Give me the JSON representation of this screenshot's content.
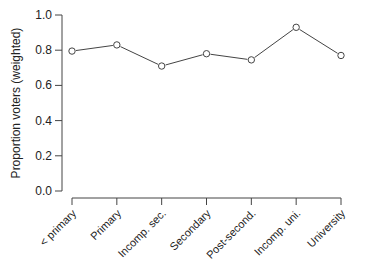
{
  "chart_data": {
    "type": "line",
    "title": "",
    "xlabel": "",
    "ylabel": "Proportion voters (weighted)",
    "ylim": [
      0,
      1
    ],
    "yticks": [
      "0.0",
      "0.2",
      "0.4",
      "0.6",
      "0.8",
      "1.0"
    ],
    "grid": false,
    "legend": null,
    "categories": [
      "< primary",
      "Primary",
      "Incomp. sec.",
      "Secondary",
      "Post-second.",
      "Incomp. uni.",
      "University"
    ],
    "series": [
      {
        "name": "Proportion voters",
        "values": [
          0.795,
          0.83,
          0.71,
          0.78,
          0.745,
          0.93,
          0.77
        ],
        "marker": "open-circle",
        "color": "#444444"
      }
    ]
  }
}
